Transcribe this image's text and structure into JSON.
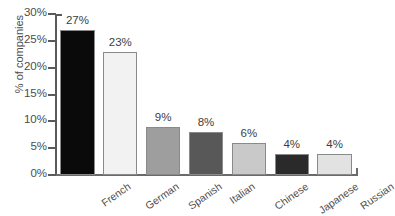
{
  "chart_data": {
    "type": "bar",
    "title": "",
    "xlabel": "",
    "ylabel": "% of companies",
    "categories": [
      "French",
      "German",
      "Spanish",
      "Italian",
      "Chinese",
      "Japanese",
      "Russian"
    ],
    "values": [
      27,
      23,
      9,
      8,
      6,
      4,
      4
    ],
    "value_labels": [
      "27%",
      "23%",
      "9%",
      "8%",
      "6%",
      "4%",
      "4%"
    ],
    "ylim": [
      0,
      30
    ],
    "ytick_values": [
      0,
      5,
      10,
      15,
      20,
      25,
      30
    ],
    "ytick_labels": [
      "0%",
      "5%",
      "10%",
      "15%",
      "20%",
      "25%",
      "30%"
    ],
    "grid": false,
    "legend": null,
    "bar_colors": [
      "#0a0a0a",
      "#f2f2f2",
      "#9e9e9e",
      "#585858",
      "#c9c9c9",
      "#2a2a2a",
      "#e2e2e2"
    ],
    "bar_edge_color": "#8a8a8a",
    "axis_color": "#5a5a5a",
    "text_color": "#4c4c4c",
    "background": "#ffffff"
  }
}
